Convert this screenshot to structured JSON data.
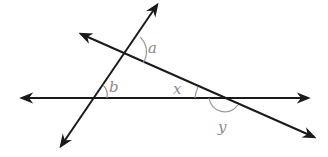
{
  "diagram": {
    "type": "geometry-angles",
    "colors": {
      "line": "#1a1a1a",
      "arc": "#9a9a9a",
      "label": "#8a8a8a",
      "background": "#ffffff"
    },
    "lines": [
      {
        "id": "horizontal",
        "from": [
          20,
          98
        ],
        "to": [
          310,
          98
        ],
        "arrows": "both"
      },
      {
        "id": "steep",
        "from": [
          60,
          147
        ],
        "to": [
          158,
          3
        ],
        "arrows": "both"
      },
      {
        "id": "slant",
        "from": [
          80,
          33
        ],
        "to": [
          316,
          138
        ],
        "arrows": "both"
      }
    ],
    "labels": {
      "a": "a",
      "b": "b",
      "x": "x",
      "y": "y"
    }
  }
}
